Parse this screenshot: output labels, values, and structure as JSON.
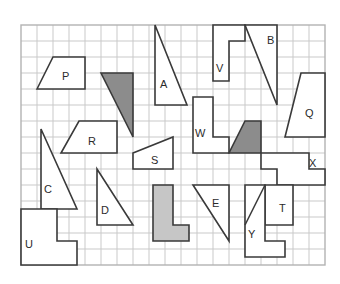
{
  "worksheet": {
    "title": "Geometric shapes on square grid",
    "background_color": "#ffffff",
    "grid": {
      "origin_x": 21,
      "origin_y": 25,
      "cell_size": 16,
      "columns": 19,
      "rows": 15,
      "line_color": "#c9c9c9",
      "border_color": "#b3b3b3",
      "visible": true
    },
    "style": {
      "outline_color": "#3a3a3a",
      "outline_width": 1.6,
      "fill_white": "#ffffff",
      "fill_dark_gray": "#8c8c8c",
      "fill_light_gray": "#c6c6c6",
      "label_color": "#2b2b2b"
    },
    "shapes": [
      {
        "id": "shape-p",
        "label": "P",
        "type": "trapezoid",
        "fill": "#ffffff",
        "points": "37,89 53,57 85,57 85,89",
        "label_x": 62,
        "label_y": 80
      },
      {
        "id": "shape-gray-triangle",
        "label": "",
        "type": "triangle",
        "fill": "#8c8c8c",
        "points": "101,73 133,73 133,137",
        "label_x": 0,
        "label_y": 0
      },
      {
        "id": "shape-a",
        "label": "A",
        "type": "triangle",
        "fill": "#ffffff",
        "points": "155,25 155,105 187,105",
        "label_x": 160,
        "label_y": 88
      },
      {
        "id": "shape-v",
        "label": "V",
        "type": "l-shape",
        "fill": "#ffffff",
        "points": "213,25 245,25 245,41 229,41 229,81 213,81",
        "label_x": 216,
        "label_y": 72
      },
      {
        "id": "shape-b",
        "label": "B",
        "type": "triangle",
        "fill": "#ffffff",
        "points": "245,25 277,25 277,105",
        "label_x": 267,
        "label_y": 44
      },
      {
        "id": "shape-q",
        "label": "Q",
        "type": "trapezoid",
        "fill": "#ffffff",
        "points": "301,73 325,73 325,137 285,137",
        "label_x": 305,
        "label_y": 117
      },
      {
        "id": "shape-r",
        "label": "R",
        "type": "trapezoid",
        "fill": "#ffffff",
        "points": "79,121 117,121 117,153 61,153",
        "label_x": 88,
        "label_y": 145
      },
      {
        "id": "shape-w",
        "label": "W",
        "type": "step-shape",
        "fill": "#ffffff",
        "points": "193,97 213,97 213,137 229,137 229,153 193,153",
        "label_x": 195,
        "label_y": 137
      },
      {
        "id": "shape-gray-trapezoid",
        "label": "",
        "type": "trapezoid",
        "fill": "#8c8c8c",
        "points": "245,121 261,121 261,153 229,153",
        "label_x": 0,
        "label_y": 0
      },
      {
        "id": "shape-s",
        "label": "S",
        "type": "quadrilateral",
        "fill": "#ffffff",
        "points": "133,153 173,137 173,169 133,169",
        "label_x": 151,
        "label_y": 164
      },
      {
        "id": "shape-x",
        "label": "X",
        "type": "zigzag-shape",
        "fill": "#ffffff",
        "points": "261,153 309,153 309,169 325,169 325,185 277,185 277,169 261,169",
        "label_x": 309,
        "label_y": 167
      },
      {
        "id": "shape-c",
        "label": "C",
        "type": "triangle",
        "fill": "#ffffff",
        "points": "41,129 41,209 77,209",
        "label_x": 44,
        "label_y": 193
      },
      {
        "id": "shape-d",
        "label": "D",
        "type": "triangle",
        "fill": "#ffffff",
        "points": "97,169 97,225 133,225",
        "label_x": 101,
        "label_y": 214
      },
      {
        "id": "shape-gray-l",
        "label": "",
        "type": "l-shape",
        "fill": "#c6c6c6",
        "points": "153,185 173,185 173,225 189,225 189,241 153,241",
        "label_x": 0,
        "label_y": 0
      },
      {
        "id": "shape-e",
        "label": "E",
        "type": "triangle",
        "fill": "#ffffff",
        "points": "193,185 229,185 229,241",
        "label_x": 212,
        "label_y": 207
      },
      {
        "id": "shape-t",
        "label": "T",
        "type": "triangle-in-square",
        "fill": "#ffffff",
        "points": "265,185 293,185 293,225 265,225",
        "label_x": 279,
        "label_y": 212
      },
      {
        "id": "shape-y",
        "label": "Y",
        "type": "l-shape",
        "fill": "#ffffff",
        "points": "245,185 265,185 265,225 265,241 285,241 285,257 245,257",
        "label_x": 248,
        "label_y": 238
      },
      {
        "id": "shape-u",
        "label": "U",
        "type": "t-shape",
        "fill": "#ffffff",
        "points": "21,209 57,209 57,241 77,241 77,265 21,265",
        "label_x": 25,
        "label_y": 248
      }
    ]
  }
}
